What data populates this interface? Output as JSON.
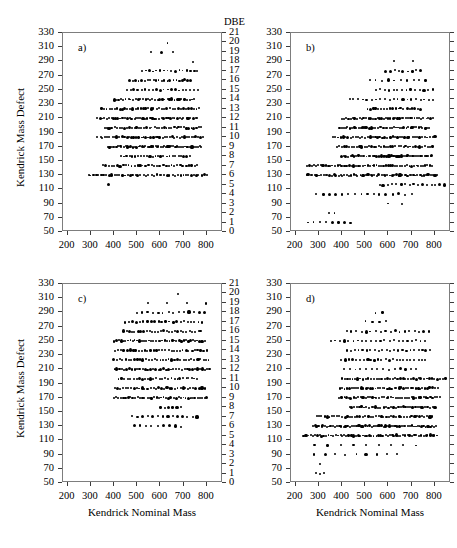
{
  "figure": {
    "axis_title_x": "Kendrick Nominal Mass",
    "axis_title_y": "Kendrick Mass Defect",
    "dbe_header": "DBE",
    "point_color": "#000000",
    "frame_color": "#7d7d7d",
    "background": "#ffffff"
  },
  "axes": {
    "x": {
      "min": 180,
      "max": 870,
      "ticks": [
        200,
        300,
        400,
        500,
        600,
        700,
        800
      ],
      "label": "Kendrick Nominal Mass"
    },
    "y_left": {
      "min": 50,
      "max": 330,
      "ticks": [
        50,
        70,
        90,
        110,
        130,
        150,
        170,
        190,
        210,
        230,
        250,
        270,
        290,
        310,
        330
      ],
      "label": "Kendrick Mass Defect"
    },
    "y_right": {
      "min": 0,
      "max": 21,
      "ticks": [
        0,
        1,
        2,
        3,
        4,
        5,
        6,
        7,
        8,
        9,
        10,
        11,
        12,
        13,
        14,
        15,
        16,
        17,
        18,
        19,
        20,
        21
      ],
      "label": "DBE"
    }
  },
  "chart_data": {
    "type": "scatter",
    "title": "",
    "xlabel": "Kendrick Nominal Mass",
    "ylabel": "Kendrick Mass Defect",
    "y2label": "DBE",
    "xlim": [
      180,
      870
    ],
    "ylim": [
      50,
      330
    ],
    "y2lim": [
      0,
      21
    ],
    "grid": false,
    "legend": "none",
    "note": "Each panel plots Kendrick mass defect vs Kendrick nominal mass; points fall on discrete DBE rows. Rows are given as DBE level with x-span and point count.",
    "panels": [
      {
        "label": "a)",
        "rows": [
          {
            "dbe": 5,
            "xmin": 372,
            "xmax": 378,
            "n": 1
          },
          {
            "dbe": 6,
            "xmin": 288,
            "xmax": 800,
            "n": 46
          },
          {
            "dbe": 7,
            "xmin": 352,
            "xmax": 760,
            "n": 34
          },
          {
            "dbe": 8,
            "xmin": 430,
            "xmax": 725,
            "n": 25
          },
          {
            "dbe": 9,
            "xmin": 370,
            "xmax": 775,
            "n": 52
          },
          {
            "dbe": 10,
            "xmin": 330,
            "xmax": 785,
            "n": 45
          },
          {
            "dbe": 11,
            "xmin": 360,
            "xmax": 775,
            "n": 40
          },
          {
            "dbe": 12,
            "xmin": 330,
            "xmax": 760,
            "n": 45
          },
          {
            "dbe": 13,
            "xmin": 345,
            "xmax": 765,
            "n": 38
          },
          {
            "dbe": 14,
            "xmin": 400,
            "xmax": 745,
            "n": 34
          },
          {
            "dbe": 15,
            "xmin": 455,
            "xmax": 760,
            "n": 20
          },
          {
            "dbe": 16,
            "xmin": 470,
            "xmax": 730,
            "n": 22
          },
          {
            "dbe": 17,
            "xmin": 520,
            "xmax": 760,
            "n": 16
          },
          {
            "dbe": 18,
            "xmin": 735,
            "xmax": 745,
            "n": 1
          },
          {
            "dbe": 19,
            "xmin": 560,
            "xmax": 655,
            "n": 3
          },
          {
            "dbe": 20,
            "xmin": 625,
            "xmax": 632,
            "n": 1
          }
        ]
      },
      {
        "label": "b)",
        "rows": [
          {
            "dbe": 1,
            "xmin": 250,
            "xmax": 440,
            "n": 8
          },
          {
            "dbe": 2,
            "xmin": 345,
            "xmax": 365,
            "n": 2
          },
          {
            "dbe": 3,
            "xmin": 600,
            "xmax": 660,
            "n": 2
          },
          {
            "dbe": 4,
            "xmin": 290,
            "xmax": 700,
            "n": 16
          },
          {
            "dbe": 5,
            "xmin": 560,
            "xmax": 840,
            "n": 16
          },
          {
            "dbe": 6,
            "xmin": 245,
            "xmax": 810,
            "n": 62
          },
          {
            "dbe": 7,
            "xmin": 250,
            "xmax": 790,
            "n": 55
          },
          {
            "dbe": 8,
            "xmin": 400,
            "xmax": 790,
            "n": 45
          },
          {
            "dbe": 9,
            "xmin": 380,
            "xmax": 790,
            "n": 40
          },
          {
            "dbe": 10,
            "xmin": 360,
            "xmax": 800,
            "n": 42
          },
          {
            "dbe": 11,
            "xmin": 390,
            "xmax": 775,
            "n": 44
          },
          {
            "dbe": 12,
            "xmin": 400,
            "xmax": 790,
            "n": 42
          },
          {
            "dbe": 13,
            "xmin": 510,
            "xmax": 740,
            "n": 20
          },
          {
            "dbe": 14,
            "xmin": 430,
            "xmax": 795,
            "n": 20
          },
          {
            "dbe": 15,
            "xmin": 545,
            "xmax": 790,
            "n": 14
          },
          {
            "dbe": 16,
            "xmin": 520,
            "xmax": 760,
            "n": 10
          },
          {
            "dbe": 17,
            "xmin": 590,
            "xmax": 740,
            "n": 9
          },
          {
            "dbe": 18,
            "xmin": 625,
            "xmax": 705,
            "n": 2
          }
        ]
      },
      {
        "label": "c)",
        "rows": [
          {
            "dbe": 6,
            "xmin": 485,
            "xmax": 690,
            "n": 9
          },
          {
            "dbe": 7,
            "xmin": 480,
            "xmax": 760,
            "n": 14
          },
          {
            "dbe": 8,
            "xmin": 600,
            "xmax": 690,
            "n": 6
          },
          {
            "dbe": 9,
            "xmin": 400,
            "xmax": 800,
            "n": 40
          },
          {
            "dbe": 10,
            "xmin": 405,
            "xmax": 790,
            "n": 34
          },
          {
            "dbe": 11,
            "xmin": 420,
            "xmax": 760,
            "n": 28
          },
          {
            "dbe": 12,
            "xmin": 400,
            "xmax": 815,
            "n": 38
          },
          {
            "dbe": 13,
            "xmin": 400,
            "xmax": 810,
            "n": 34
          },
          {
            "dbe": 14,
            "xmin": 405,
            "xmax": 800,
            "n": 32
          },
          {
            "dbe": 15,
            "xmin": 400,
            "xmax": 790,
            "n": 40
          },
          {
            "dbe": 16,
            "xmin": 440,
            "xmax": 775,
            "n": 28
          },
          {
            "dbe": 17,
            "xmin": 450,
            "xmax": 780,
            "n": 22
          },
          {
            "dbe": 18,
            "xmin": 500,
            "xmax": 790,
            "n": 14
          },
          {
            "dbe": 19,
            "xmin": 545,
            "xmax": 800,
            "n": 4
          },
          {
            "dbe": 20,
            "xmin": 675,
            "xmax": 682,
            "n": 1
          }
        ]
      },
      {
        "label": "d)",
        "rows": [
          {
            "dbe": 1,
            "xmin": 290,
            "xmax": 320,
            "n": 3
          },
          {
            "dbe": 2,
            "xmin": 300,
            "xmax": 308,
            "n": 1
          },
          {
            "dbe": 3,
            "xmin": 280,
            "xmax": 640,
            "n": 9
          },
          {
            "dbe": 4,
            "xmin": 285,
            "xmax": 720,
            "n": 9
          },
          {
            "dbe": 5,
            "xmin": 235,
            "xmax": 810,
            "n": 60
          },
          {
            "dbe": 6,
            "xmin": 275,
            "xmax": 805,
            "n": 62
          },
          {
            "dbe": 7,
            "xmin": 290,
            "xmax": 790,
            "n": 46
          },
          {
            "dbe": 8,
            "xmin": 430,
            "xmax": 800,
            "n": 36
          },
          {
            "dbe": 9,
            "xmin": 390,
            "xmax": 820,
            "n": 44
          },
          {
            "dbe": 10,
            "xmin": 390,
            "xmax": 810,
            "n": 42
          },
          {
            "dbe": 11,
            "xmin": 400,
            "xmax": 845,
            "n": 40
          },
          {
            "dbe": 12,
            "xmin": 410,
            "xmax": 720,
            "n": 14
          },
          {
            "dbe": 13,
            "xmin": 400,
            "xmax": 760,
            "n": 24
          },
          {
            "dbe": 14,
            "xmin": 420,
            "xmax": 780,
            "n": 22
          },
          {
            "dbe": 15,
            "xmin": 350,
            "xmax": 760,
            "n": 22
          },
          {
            "dbe": 16,
            "xmin": 420,
            "xmax": 775,
            "n": 18
          },
          {
            "dbe": 17,
            "xmin": 500,
            "xmax": 590,
            "n": 4
          },
          {
            "dbe": 18,
            "xmin": 545,
            "xmax": 575,
            "n": 2
          }
        ]
      }
    ]
  }
}
